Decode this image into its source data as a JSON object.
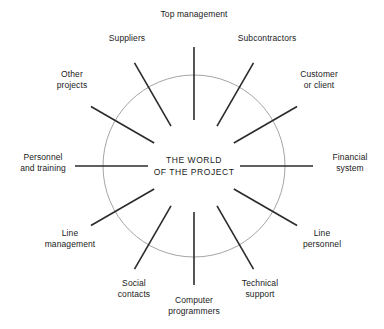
{
  "figure": {
    "center_text": "THE WORLD\nOF THE PROJECT",
    "circle": {
      "cx": 194,
      "cy": 166,
      "r": 91,
      "stroke": "#9a9a9a",
      "stroke_width": 0.9
    },
    "spoke": {
      "inner_radius": 46,
      "outer_radius": 119,
      "stroke": "#2b2b2b",
      "stroke_width": 1.6
    },
    "background": "#ffffff",
    "text_color": "#1a1a1a"
  },
  "chart_data": {
    "type": "diagram",
    "title": "THE WORLD OF THE PROJECT",
    "layout": "radial-spoke",
    "categories": [
      "Top management",
      "Subcontractors",
      "Customer or client",
      "Financial system",
      "Line personnel",
      "Technical support",
      "Computer programmers",
      "Social contacts",
      "Line management",
      "Personnel and training",
      "Other projects",
      "Suppliers"
    ],
    "angles_deg": [
      90,
      60,
      30,
      0,
      330,
      300,
      270,
      240,
      210,
      180,
      150,
      120
    ]
  },
  "spokes": [
    {
      "id": "top-management",
      "label": "Top management",
      "angle": 90,
      "label_x": 194,
      "label_y": 14,
      "align": "center"
    },
    {
      "id": "subcontractors",
      "label": "Subcontractors",
      "angle": 60,
      "label_x": 267,
      "label_y": 38,
      "align": "center"
    },
    {
      "id": "customer-or-client",
      "label": "Customer\nor client",
      "angle": 30,
      "label_x": 319,
      "label_y": 79,
      "align": "center"
    },
    {
      "id": "financial-system",
      "label": "Financial\nsystem",
      "angle": 0,
      "label_x": 350,
      "label_y": 162,
      "align": "center"
    },
    {
      "id": "line-personnel",
      "label": "Line\npersonnel",
      "angle": 330,
      "label_x": 322,
      "label_y": 238,
      "align": "center"
    },
    {
      "id": "technical-support",
      "label": "Technical\nsupport",
      "angle": 300,
      "label_x": 260,
      "label_y": 288,
      "align": "center"
    },
    {
      "id": "computer-programmers",
      "label": "Computer\nprogrammers",
      "angle": 270,
      "label_x": 194,
      "label_y": 305,
      "align": "center"
    },
    {
      "id": "social-contacts",
      "label": "Social\ncontacts",
      "angle": 240,
      "label_x": 134,
      "label_y": 288,
      "align": "center"
    },
    {
      "id": "line-management",
      "label": "Line\nmanagement",
      "angle": 210,
      "label_x": 70,
      "label_y": 238,
      "align": "center"
    },
    {
      "id": "personnel-and-training",
      "label": "Personnel\nand training",
      "angle": 180,
      "label_x": 43,
      "label_y": 162,
      "align": "center"
    },
    {
      "id": "other-projects",
      "label": "Other\nprojects",
      "angle": 150,
      "label_x": 72,
      "label_y": 79,
      "align": "center"
    },
    {
      "id": "suppliers",
      "label": "Suppliers",
      "angle": 120,
      "label_x": 127,
      "label_y": 38,
      "align": "center"
    }
  ]
}
